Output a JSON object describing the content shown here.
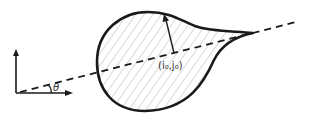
{
  "diagram": {
    "center_label": "(i₀,j₀)",
    "angle_label": "θ",
    "colors": {
      "stroke": "#1a1a1a",
      "hatch": "#9a9a9a",
      "background": "#ffffff"
    }
  }
}
